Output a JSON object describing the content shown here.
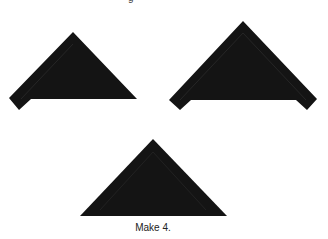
{
  "top_cropped_text": "g",
  "caption": "Make 4.",
  "colors": {
    "fabric": "#141414",
    "seam": "#262626",
    "background": "#ffffff"
  },
  "shapes": [
    {
      "name": "triangle-with-left-arm",
      "points": "73,32 137,99 31,99 19,110 9,98"
    },
    {
      "name": "triangle-with-both-arms",
      "points": "243,21 317,99 307,110 296,100 191,100 180,110 169,100"
    },
    {
      "name": "plain-triangle",
      "points": "153,139 227,216 80,216"
    }
  ]
}
